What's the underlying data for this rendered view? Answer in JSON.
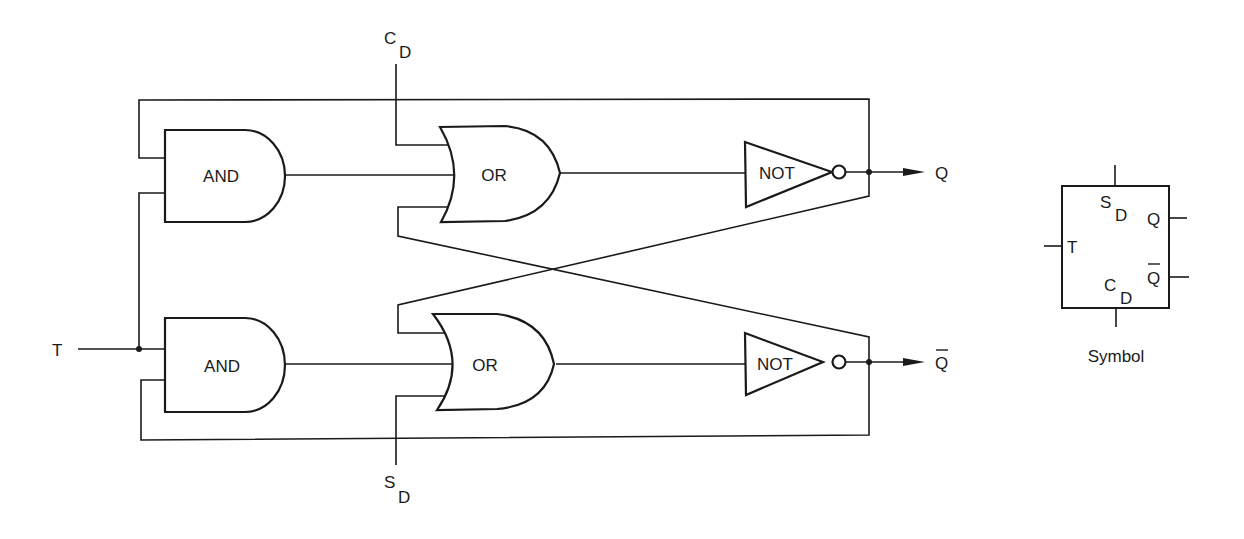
{
  "diagram": {
    "type": "T flip-flop logic circuit",
    "gates": {
      "and_upper": {
        "label": "AND"
      },
      "and_lower": {
        "label": "AND"
      },
      "or_upper": {
        "label": "OR"
      },
      "or_lower": {
        "label": "OR"
      },
      "not_upper": {
        "label": "NOT"
      },
      "not_lower": {
        "label": "NOT"
      }
    },
    "inputs": {
      "t": {
        "label": "T"
      },
      "cd": {
        "main": "C",
        "sub": "D"
      },
      "sd": {
        "main": "S",
        "sub": "D"
      }
    },
    "outputs": {
      "q": {
        "label": "Q"
      },
      "qbar": {
        "label": "Q",
        "overbar": true
      }
    },
    "symbol": {
      "caption": "Symbol",
      "pins": {
        "sd": {
          "main": "S",
          "sub": "D"
        },
        "cd": {
          "main": "C",
          "sub": "D"
        },
        "t": "T",
        "q": "Q",
        "qbar": "Q"
      }
    },
    "colors": {
      "ink": "#1a1a1a",
      "background": "#ffffff"
    }
  }
}
